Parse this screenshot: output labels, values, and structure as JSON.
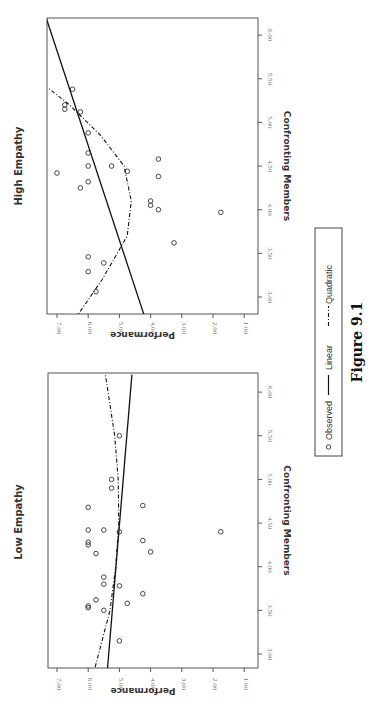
{
  "figure": {
    "caption": "Figure 9.1",
    "orientation": "rotated 90° clockwise"
  },
  "legend": {
    "items": [
      {
        "symbol": "circle",
        "label": "Observed"
      },
      {
        "symbol": "solid-line",
        "label": "Linear"
      },
      {
        "symbol": "dash-dot-line",
        "label": "Quadratic"
      }
    ]
  },
  "chart_data": [
    {
      "type": "scatter",
      "title": "High Empathy",
      "xlabel": "Confronting Members",
      "ylabel": "Performance",
      "xlim": [
        2.75,
        6.2
      ],
      "ylim": [
        1.0,
        7.3
      ],
      "xticks": [
        "3.00",
        "3.50",
        "4.00",
        "4.50",
        "5.00",
        "5.50",
        "6.00"
      ],
      "yticks": [
        "1.00",
        "2.00",
        "3.00",
        "4.00",
        "5.00",
        "6.00",
        "7.00"
      ],
      "grid": false,
      "series": [
        {
          "name": "Observed",
          "points": [
            [
              3.06,
              5.75
            ],
            [
              3.29,
              6.0
            ],
            [
              3.39,
              5.5
            ],
            [
              3.46,
              6.0
            ],
            [
              3.62,
              3.25
            ],
            [
              3.97,
              1.75
            ],
            [
              4.0,
              3.75
            ],
            [
              4.05,
              4.0
            ],
            [
              4.1,
              4.0
            ],
            [
              4.25,
              6.25
            ],
            [
              4.32,
              6.0
            ],
            [
              4.38,
              3.75
            ],
            [
              4.42,
              7.0
            ],
            [
              4.44,
              4.75
            ],
            [
              4.5,
              5.25
            ],
            [
              4.5,
              6.0
            ],
            [
              4.58,
              3.75
            ],
            [
              4.65,
              6.0
            ],
            [
              4.88,
              6.0
            ],
            [
              5.12,
              6.25
            ],
            [
              5.15,
              6.75
            ],
            [
              5.2,
              6.75
            ],
            [
              5.38,
              6.5
            ]
          ]
        },
        {
          "name": "Linear",
          "fit": {
            "x": [
              2.75,
              6.2
            ],
            "y": [
              4.17,
              7.35
            ]
          }
        },
        {
          "name": "Quadratic",
          "fit": {
            "x": [
              2.75,
              3.2,
              3.7,
              4.1,
              4.5,
              4.85,
              5.2,
              5.4
            ],
            "y": [
              6.42,
              5.55,
              4.75,
              4.62,
              4.85,
              5.6,
              6.6,
              7.3
            ]
          }
        }
      ]
    },
    {
      "type": "scatter",
      "title": "Low Empathy",
      "xlabel": "Confronting Members",
      "ylabel": "Performance",
      "xlim": [
        2.75,
        6.2
      ],
      "ylim": [
        1.0,
        7.3
      ],
      "xticks": [
        "3.00",
        "3.50",
        "4.00",
        "4.50",
        "5.00",
        "5.50",
        "6.00"
      ],
      "yticks": [
        "1.00",
        "2.00",
        "3.00",
        "4.00",
        "5.00",
        "6.00",
        "7.00"
      ],
      "grid": false,
      "series": [
        {
          "name": "Observed",
          "points": [
            [
              3.15,
              5.0
            ],
            [
              3.5,
              5.5
            ],
            [
              3.53,
              6.0
            ],
            [
              3.55,
              6.0
            ],
            [
              3.58,
              4.75
            ],
            [
              3.62,
              5.75
            ],
            [
              3.69,
              4.25
            ],
            [
              3.78,
              5.0
            ],
            [
              3.8,
              5.5
            ],
            [
              3.88,
              5.5
            ],
            [
              4.15,
              5.75
            ],
            [
              4.17,
              4.0
            ],
            [
              4.25,
              6.0
            ],
            [
              4.28,
              6.0
            ],
            [
              4.3,
              4.25
            ],
            [
              4.4,
              5.0
            ],
            [
              4.42,
              6.0
            ],
            [
              4.42,
              5.5
            ],
            [
              4.4,
              1.75
            ],
            [
              4.7,
              4.25
            ],
            [
              4.68,
              6.0
            ],
            [
              4.9,
              5.25
            ],
            [
              5.0,
              5.25
            ],
            [
              5.5,
              5.0
            ]
          ]
        },
        {
          "name": "Linear",
          "fit": {
            "x": [
              2.75,
              6.2
            ],
            "y": [
              5.4,
              4.6
            ]
          }
        },
        {
          "name": "Quadratic",
          "fit": {
            "x": [
              2.75,
              3.5,
              4.0,
              4.5,
              5.0,
              5.5,
              6.2
            ],
            "y": [
              5.85,
              5.3,
              5.12,
              5.02,
              5.04,
              5.15,
              5.45
            ]
          }
        }
      ]
    }
  ]
}
